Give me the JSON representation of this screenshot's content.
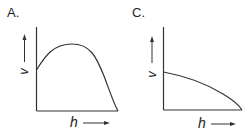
{
  "panels": [
    {
      "id": "A",
      "label": "A.",
      "x_axis_label": "h",
      "y_axis_label": "v",
      "curve_description": "rises from mid-height to a peak, then falls to zero at the end of the axis"
    },
    {
      "id": "C",
      "label": "C.",
      "x_axis_label": "h",
      "y_axis_label": "v",
      "curve_description": "starts at mid-height and decreases monotonically (concave down) to zero"
    }
  ],
  "colors": {
    "line": "#333333",
    "background": "#ffffff"
  }
}
